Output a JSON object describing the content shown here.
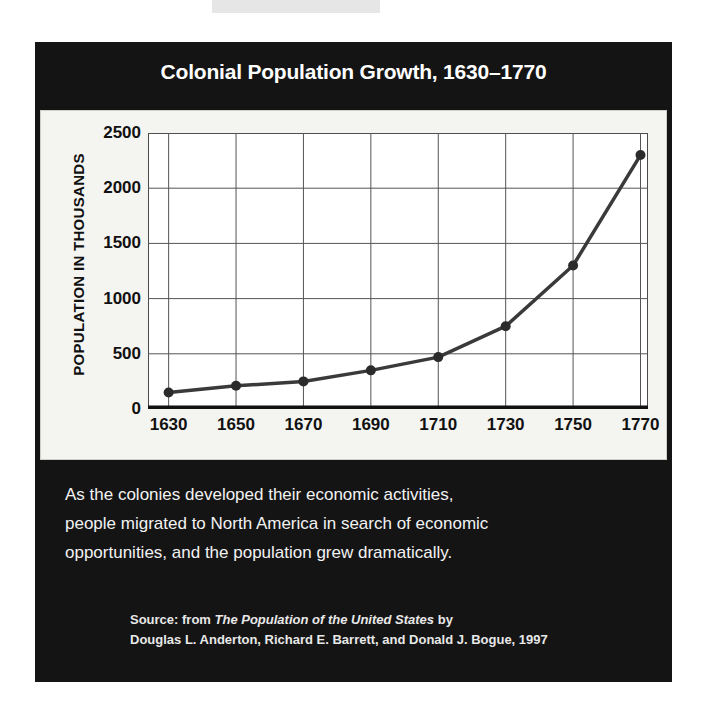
{
  "panel": {
    "background_color": "#141414",
    "text_color": "#ffffff"
  },
  "chart_card": {
    "background_color": "#f4f4f0"
  },
  "title": "Colonial Population Growth, 1630–1770",
  "body_text": {
    "line1": "As the colonies developed their economic activities,",
    "line2": "people migrated to North America in search of economic",
    "line3": "opportunities, and the population grew dramatically."
  },
  "source": {
    "prefix": "Source:  from ",
    "work_title": "The Population of the United States",
    "by": " by",
    "authors": "Douglas L. Anderton, Richard E. Barrett, and Donald J. Bogue, 1997"
  },
  "chart_data": {
    "type": "line",
    "title": "Colonial Population Growth, 1630–1770",
    "xlabel": "",
    "ylabel": "POPULATION IN THOUSANDS",
    "categories": [
      1630,
      1650,
      1670,
      1690,
      1710,
      1730,
      1750,
      1770
    ],
    "x_tick_labels": [
      "1630",
      "1650",
      "1670",
      "1690",
      "1710",
      "1730",
      "1750",
      "1770"
    ],
    "values": [
      150,
      210,
      250,
      350,
      470,
      750,
      1300,
      2300
    ],
    "y_tick_labels": [
      "0",
      "500",
      "1000",
      "1500",
      "2000",
      "2500"
    ],
    "y_ticks": [
      0,
      500,
      1000,
      1500,
      2000,
      2500
    ],
    "ylim": [
      0,
      2500
    ],
    "xlim": [
      1630,
      1770
    ],
    "grid": true,
    "legend": "none",
    "series_color": "#3a3a3a",
    "marker": "circle",
    "marker_color": "#2b2b2b"
  }
}
